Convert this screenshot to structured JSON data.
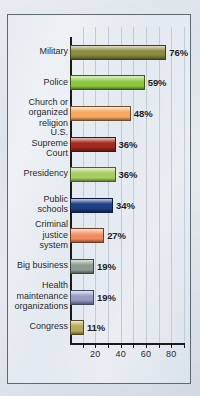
{
  "chart_data": {
    "type": "bar",
    "orientation": "horizontal",
    "title": "",
    "xlabel": "",
    "ylabel": "",
    "xlim": [
      0,
      90
    ],
    "xticks": [
      20,
      40,
      60,
      80
    ],
    "xtick_labels": [
      "20",
      "40",
      "60",
      "80"
    ],
    "minor_tick_step": 10,
    "grid": true,
    "grid_axis": "x",
    "legend": "none",
    "value_suffix": "%",
    "categories": [
      "Military",
      "Police",
      "Church or organized religion",
      "U.S. Supreme Court",
      "Presidency",
      "Public schools",
      "Criminal justice system",
      "Big business",
      "Health maintenance organizations",
      "Congress"
    ],
    "values": [
      76,
      59,
      48,
      36,
      36,
      34,
      27,
      19,
      19,
      11
    ],
    "value_labels": [
      "76%",
      "59%",
      "48%",
      "36%",
      "36%",
      "34%",
      "27%",
      "19%",
      "19%",
      "11%"
    ],
    "bar_colors": [
      "#8a8c42",
      "#8cc63f",
      "#f5a councils",
      "#a32a1e",
      "#a8ce63",
      "#1f3f86",
      "#ef8b5e",
      "#8c9b91",
      "#9a9cc8",
      "#b5ab5a"
    ],
    "bars": [
      {
        "label_lines": [
          "Military"
        ],
        "value": 76,
        "value_label": "76%",
        "color": "#8a8c42"
      },
      {
        "label_lines": [
          "Police"
        ],
        "value": 59,
        "value_label": "59%",
        "color": "#8cc63f"
      },
      {
        "label_lines": [
          "Church or",
          "organized",
          "religion"
        ],
        "value": 48,
        "value_label": "48%",
        "color": "#f7a863"
      },
      {
        "label_lines": [
          "U.S.",
          "Supreme",
          "Court"
        ],
        "value": 36,
        "value_label": "36%",
        "color": "#a32a1e"
      },
      {
        "label_lines": [
          "Presidency"
        ],
        "value": 36,
        "value_label": "36%",
        "color": "#a8ce63"
      },
      {
        "label_lines": [
          "Public",
          "schools"
        ],
        "value": 34,
        "value_label": "34%",
        "color": "#1f3f86"
      },
      {
        "label_lines": [
          "Criminal",
          "justice",
          "system"
        ],
        "value": 27,
        "value_label": "27%",
        "color": "#ef8b5e"
      },
      {
        "label_lines": [
          "Big business"
        ],
        "value": 19,
        "value_label": "19%",
        "color": "#8c9b91"
      },
      {
        "label_lines": [
          "Health",
          "maintenance",
          "organizations"
        ],
        "value": 19,
        "value_label": "19%",
        "color": "#9a9cc8"
      },
      {
        "label_lines": [
          "Congress"
        ],
        "value": 11,
        "value_label": "11%",
        "color": "#b5ab5a"
      }
    ]
  }
}
